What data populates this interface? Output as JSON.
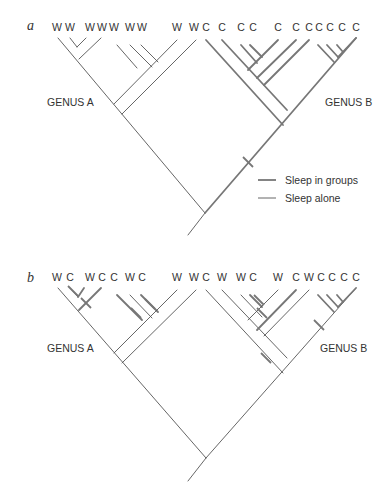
{
  "figure": {
    "width": 382,
    "height": 490,
    "colors": {
      "thin": "#555555",
      "thick": "#777777",
      "text": "#333333",
      "background": "#ffffff"
    }
  },
  "legend": {
    "items": [
      {
        "label": "Sleep in groups",
        "style": "thick",
        "x1": 258,
        "x2": 276,
        "y": 180,
        "tx": 285,
        "ty": 184
      },
      {
        "label": "Sleep alone",
        "style": "thin",
        "x1": 258,
        "x2": 276,
        "y": 198,
        "tx": 285,
        "ty": 202
      }
    ]
  },
  "panels": [
    {
      "id": "a",
      "letter": "a",
      "letter_pos": [
        27,
        30
      ],
      "genus_labels": [
        {
          "text": "GENUS A",
          "x": 47,
          "y": 106
        },
        {
          "text": "GENUS B",
          "x": 325,
          "y": 106
        }
      ],
      "tips": [
        {
          "t": "W",
          "x": 57
        },
        {
          "t": "W",
          "x": 70
        },
        {
          "t": "W",
          "x": 90
        },
        {
          "t": "W",
          "x": 102
        },
        {
          "t": "W",
          "x": 114
        },
        {
          "t": "W",
          "x": 130
        },
        {
          "t": "W",
          "x": 142
        },
        {
          "t": "W",
          "x": 177
        },
        {
          "t": "W",
          "x": 194
        },
        {
          "t": "C",
          "x": 206
        },
        {
          "t": "C",
          "x": 222
        },
        {
          "t": "C",
          "x": 241
        },
        {
          "t": "C",
          "x": 253
        },
        {
          "t": "C",
          "x": 278
        },
        {
          "t": "C",
          "x": 296
        },
        {
          "t": "C",
          "x": 309
        },
        {
          "t": "C",
          "x": 319
        },
        {
          "t": "C",
          "x": 330
        },
        {
          "t": "C",
          "x": 342
        },
        {
          "t": "C",
          "x": 356
        }
      ],
      "tip_y": 31,
      "segments": [
        {
          "s": "thin",
          "p": [
            188,
            235,
            205,
            213
          ]
        },
        {
          "s": "thin",
          "p": [
            205,
            213,
            58,
            38
          ]
        },
        {
          "s": "thin",
          "p": [
            70,
            38,
            77,
            47
          ]
        },
        {
          "s": "thin",
          "p": [
            86,
            38,
            77,
            47
          ]
        },
        {
          "s": "thin",
          "p": [
            101,
            38,
            79,
            59
          ]
        },
        {
          "s": "thin",
          "p": [
            117,
            45,
            137,
            68
          ]
        },
        {
          "s": "thin",
          "p": [
            130,
            45,
            152,
            67
          ]
        },
        {
          "s": "thin",
          "p": [
            141,
            45,
            158,
            62
          ]
        },
        {
          "s": "thin",
          "p": [
            177,
            40,
            114,
            104
          ]
        },
        {
          "s": "thin",
          "p": [
            196,
            40,
            122,
            114
          ]
        },
        {
          "s": "thick",
          "p": [
            205,
            213,
            356,
            38
          ]
        },
        {
          "s": "thick",
          "p": [
            206,
            40,
            283,
            125
          ]
        },
        {
          "s": "thick",
          "p": [
            222,
            40,
            287,
            110
          ]
        },
        {
          "s": "thick",
          "p": [
            241,
            45,
            257,
            63
          ]
        },
        {
          "s": "thick",
          "p": [
            250,
            45,
            262,
            57
          ]
        },
        {
          "s": "thick",
          "p": [
            278,
            40,
            248,
            70
          ]
        },
        {
          "s": "thick",
          "p": [
            296,
            40,
            257,
            78
          ]
        },
        {
          "s": "thick",
          "p": [
            309,
            40,
            264,
            85
          ]
        },
        {
          "s": "thick",
          "p": [
            318,
            45,
            334,
            62
          ]
        },
        {
          "s": "thick",
          "p": [
            327,
            45,
            338,
            57
          ]
        },
        {
          "s": "thick",
          "p": [
            337,
            45,
            343,
            52
          ]
        },
        {
          "s": "thick",
          "p": [
            356,
            38,
            338,
            57
          ]
        }
      ],
      "ticks": [
        {
          "x": 248,
          "y": 162
        }
      ]
    },
    {
      "id": "b",
      "letter": "b",
      "letter_pos": [
        27,
        282
      ],
      "genus_labels": [
        {
          "text": "GENUS A",
          "x": 47,
          "y": 352
        },
        {
          "text": "GENUS B",
          "x": 320,
          "y": 352
        }
      ],
      "tips": [
        {
          "t": "W",
          "x": 57
        },
        {
          "t": "C",
          "x": 70
        },
        {
          "t": "W",
          "x": 90
        },
        {
          "t": "C",
          "x": 102
        },
        {
          "t": "C",
          "x": 114
        },
        {
          "t": "W",
          "x": 130
        },
        {
          "t": "C",
          "x": 142
        },
        {
          "t": "W",
          "x": 177
        },
        {
          "t": "W",
          "x": 194
        },
        {
          "t": "C",
          "x": 206
        },
        {
          "t": "W",
          "x": 222
        },
        {
          "t": "W",
          "x": 241
        },
        {
          "t": "C",
          "x": 253
        },
        {
          "t": "W",
          "x": 278
        },
        {
          "t": "C",
          "x": 296
        },
        {
          "t": "W",
          "x": 309
        },
        {
          "t": "C",
          "x": 321
        },
        {
          "t": "C",
          "x": 332
        },
        {
          "t": "C",
          "x": 344
        },
        {
          "t": "C",
          "x": 356
        }
      ],
      "tip_y": 281,
      "segments": [
        {
          "s": "thin",
          "p": [
            188,
            481,
            206,
            458
          ]
        },
        {
          "s": "thin",
          "p": [
            206,
            458,
            58,
            288
          ]
        },
        {
          "s": "thin",
          "p": [
            70,
            288,
            78,
            297
          ]
        },
        {
          "s": "thick",
          "p": [
            84,
            288,
            78,
            297
          ]
        },
        {
          "s": "thick",
          "p": [
            101,
            288,
            79,
            310
          ]
        },
        {
          "s": "thick",
          "p": [
            117,
            295,
            142,
            320
          ]
        },
        {
          "s": "thin",
          "p": [
            130,
            295,
            152,
            318
          ]
        },
        {
          "s": "thick",
          "p": [
            141,
            295,
            158,
            312
          ]
        },
        {
          "s": "thin",
          "p": [
            177,
            290,
            114,
            353
          ]
        },
        {
          "s": "thin",
          "p": [
            196,
            290,
            122,
            363
          ]
        },
        {
          "s": "thin",
          "p": [
            206,
            458,
            356,
            288
          ]
        },
        {
          "s": "thin",
          "p": [
            206,
            290,
            283,
            373
          ]
        },
        {
          "s": "thin",
          "p": [
            222,
            290,
            287,
            358
          ]
        },
        {
          "s": "thin",
          "p": [
            241,
            295,
            262,
            317
          ]
        },
        {
          "s": "thick",
          "p": [
            250,
            295,
            262,
            307
          ]
        },
        {
          "s": "thin",
          "p": [
            278,
            290,
            248,
            320
          ]
        },
        {
          "s": "thick",
          "p": [
            296,
            290,
            257,
            330
          ]
        },
        {
          "s": "thin",
          "p": [
            309,
            290,
            264,
            336
          ]
        },
        {
          "s": "thick",
          "p": [
            318,
            295,
            334,
            312
          ]
        },
        {
          "s": "thick",
          "p": [
            327,
            295,
            338,
            307
          ]
        },
        {
          "s": "thick",
          "p": [
            337,
            295,
            343,
            302
          ]
        },
        {
          "s": "thick",
          "p": [
            356,
            288,
            338,
            307
          ]
        }
      ],
      "ticks": [
        {
          "x": 73,
          "y": 291
        },
        {
          "x": 86,
          "y": 303
        },
        {
          "x": 136,
          "y": 313
        },
        {
          "x": 150,
          "y": 304
        },
        {
          "x": 259,
          "y": 300
        },
        {
          "x": 262,
          "y": 313
        },
        {
          "x": 266,
          "y": 358
        },
        {
          "x": 319,
          "y": 325
        }
      ]
    }
  ]
}
